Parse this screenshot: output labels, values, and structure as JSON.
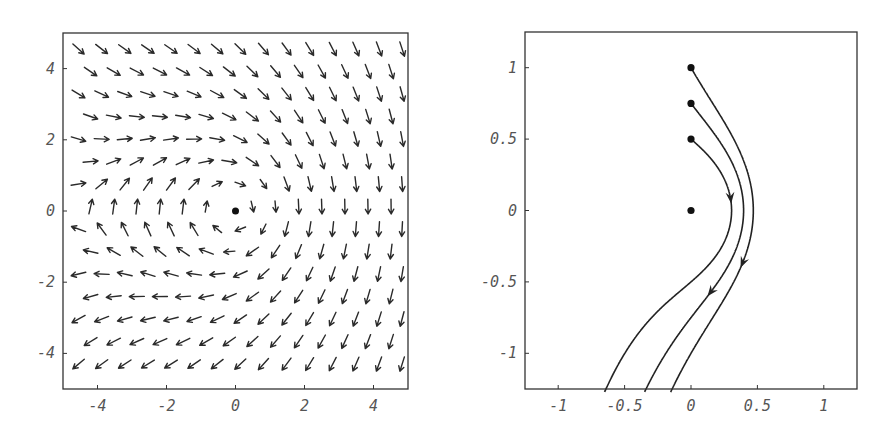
{
  "chart_data": [
    {
      "type": "vector_field",
      "title": "",
      "xlabel": "",
      "ylabel": "",
      "xlim": [
        -5,
        5
      ],
      "ylim": [
        -5,
        5
      ],
      "grid": false,
      "xticks": [
        -4,
        -2,
        0,
        2,
        4
      ],
      "yticks": [
        -4,
        -2,
        0,
        2,
        4
      ],
      "xtick_labels": [
        "-4",
        "-2",
        "0",
        "2",
        "4"
      ],
      "ytick_labels": [
        "-4",
        "-2",
        "0",
        "2",
        "4"
      ],
      "field": {
        "description": "point vortex (clockwise) at origin plus uniform downward flow",
        "formula": "u = k*y/(x^2+y^2), v = -k*x/(x^2+y^2) - 1",
        "k": 4.8
      },
      "arrow_grid": {
        "rows": 15,
        "row_y_top": 4.55,
        "row_y_bottom": -4.3,
        "even_row_cols": 15,
        "even_row_x_start": -4.55,
        "odd_row_cols": 14,
        "odd_row_x_start": -4.2,
        "col_step": 0.67,
        "arrow_length_px": 15
      },
      "points": [
        {
          "x": 0,
          "y": 0,
          "label": "vortex center"
        }
      ]
    },
    {
      "type": "line",
      "title": "",
      "xlabel": "",
      "ylabel": "",
      "xlim": [
        -1.25,
        1.25
      ],
      "ylim": [
        -1.25,
        1.25
      ],
      "grid": false,
      "xticks": [
        -1,
        -0.5,
        0,
        0.5,
        1
      ],
      "yticks": [
        -1,
        -0.5,
        0,
        0.5,
        1
      ],
      "xtick_labels": [
        "-1",
        "-0.5",
        "0",
        "0.5",
        "1"
      ],
      "ytick_labels": [
        "-1",
        "-0.5",
        "0",
        "0.5",
        "1"
      ],
      "field": {
        "formula": "u = k*y/(x^2+y^2), v = -k*x/(x^2+y^2) - 1",
        "k": 0.62
      },
      "series": [
        {
          "name": "closed orbit from (0, 0.5)",
          "start": [
            0,
            0.5
          ],
          "closed": true,
          "arrow_at_y": 0.05
        },
        {
          "name": "trajectory from (0, 0.75)",
          "start": [
            0,
            0.75
          ],
          "closed": false,
          "arrow_at_y": -0.6
        },
        {
          "name": "trajectory from (0, 1)",
          "start": [
            0,
            1
          ],
          "closed": false,
          "arrow_at_y": -0.4
        }
      ],
      "points": [
        {
          "x": 0,
          "y": 1
        },
        {
          "x": 0,
          "y": 0.75
        },
        {
          "x": 0,
          "y": 0.5
        },
        {
          "x": 0,
          "y": 0
        }
      ]
    }
  ],
  "layout": {
    "left_panel": {
      "x0": 63,
      "y0": 33,
      "x1": 408,
      "y1": 389
    },
    "right_panel": {
      "x0": 525,
      "y0": 32,
      "x1": 857,
      "y1": 389
    }
  }
}
